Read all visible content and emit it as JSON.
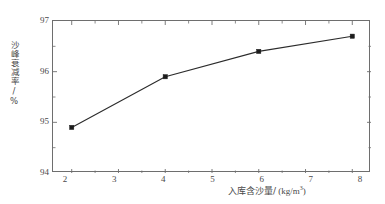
{
  "chart_data": {
    "type": "line",
    "title": "",
    "xlabel": "入库含沙量/ (kg/m³)",
    "xlabel_text": "入库含沙量/",
    "xlabel_unit_open": " (kg/m",
    "xlabel_unit_exp": "3",
    "xlabel_unit_close": ")",
    "ylabel": "沙峰衰减率/%",
    "x": [
      2,
      4,
      6,
      8
    ],
    "values": [
      94.9,
      95.9,
      96.4,
      96.7
    ],
    "series": [
      {
        "name": "沙峰衰减率",
        "values": [
          94.9,
          95.9,
          96.4,
          96.7
        ]
      }
    ],
    "xlim": [
      1.6,
      8.4
    ],
    "ylim": [
      94,
      97
    ],
    "xticks": [
      2,
      3,
      4,
      5,
      6,
      7,
      8
    ],
    "xtick_labels": [
      "2",
      "3",
      "4",
      "5",
      "6",
      "7",
      "8"
    ],
    "xminor_ticks": [
      2.5,
      3.5,
      4.5,
      5.5,
      6.5,
      7.5
    ],
    "yticks": [
      94,
      95,
      96,
      97
    ],
    "ytick_labels": [
      "94",
      "95",
      "96",
      "97"
    ],
    "yminor_ticks": [
      94.5,
      95.5,
      96.5
    ],
    "grid": false,
    "legend": false,
    "marker": "square",
    "line_color": "#2b2b2b",
    "marker_color": "#1c1c1c",
    "frame_color": "#6e6e6e",
    "background": "#ffffff"
  }
}
